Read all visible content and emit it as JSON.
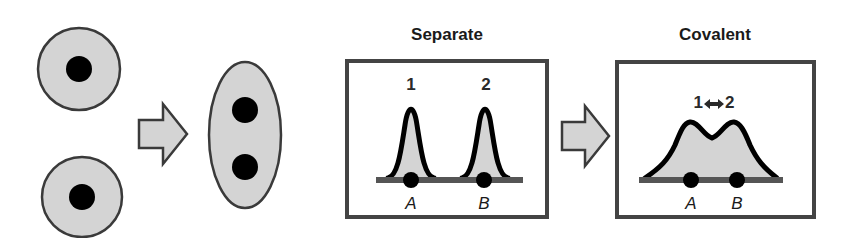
{
  "colors": {
    "fill_gray": "#d4d4d4",
    "outline": "#3a3a3a",
    "nucleus": "#000000",
    "curve": "#000000",
    "baseline": "#555555",
    "box_border": "#444444",
    "background": "#ffffff"
  },
  "left_panel": {
    "separate_atoms": [
      {
        "name": "atom-top",
        "cx": 79,
        "cy": 69,
        "r": 41,
        "nucleus_r": 13
      },
      {
        "name": "atom-bottom",
        "cx": 82,
        "cy": 197,
        "r": 40,
        "nucleus_r": 13
      }
    ],
    "arrow": {
      "icon": "right-block-arrow",
      "x": 138,
      "y": 103,
      "w": 50,
      "h": 62
    },
    "molecule": {
      "cx": 245,
      "cy": 135,
      "rx": 36,
      "ry": 73,
      "nuclei": [
        {
          "cy": 110
        },
        {
          "cy": 167
        }
      ],
      "nucleus_r": 13
    }
  },
  "separate_panel": {
    "title": "Separate",
    "peak_labels": [
      "1",
      "2"
    ],
    "nucleus_labels": [
      "A",
      "B"
    ]
  },
  "middle_arrow": {
    "icon": "right-block-arrow"
  },
  "covalent_panel": {
    "title": "Covalent",
    "peak_label": "1 ⇔ 2",
    "peak_label_left": "1",
    "peak_label_arrow": "⬌",
    "peak_label_right": "2",
    "nucleus_labels": [
      "A",
      "B"
    ]
  }
}
